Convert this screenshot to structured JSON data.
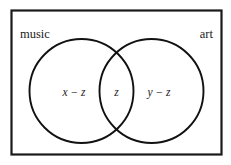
{
  "diagram": {
    "type": "venn-two-set",
    "universe": {
      "name": "universe-rectangle",
      "border_color": "#1a1a1a",
      "fill_color": "#ffffff"
    },
    "sets": [
      {
        "id": "music",
        "label": "music",
        "label_position": "top-left",
        "stroke_color": "#111111"
      },
      {
        "id": "art",
        "label": "art",
        "label_position": "top-right",
        "stroke_color": "#111111"
      }
    ],
    "regions": [
      {
        "id": "music-only",
        "label": "x − z",
        "description": "music only"
      },
      {
        "id": "intersection",
        "label": "z",
        "description": "music and art"
      },
      {
        "id": "art-only",
        "label": "y − z",
        "description": "art only"
      }
    ]
  }
}
